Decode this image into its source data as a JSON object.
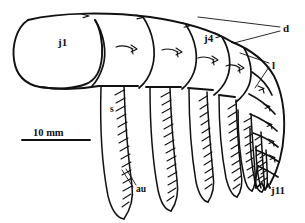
{
  "figure": {
    "background_color": "#ffffff",
    "ink_color": "#111111",
    "width_px": 305,
    "height_px": 223
  },
  "scale_bar": {
    "label": "10 mm",
    "length_px": 68,
    "x": 22,
    "y": 133
  },
  "labels": [
    {
      "key": "j1",
      "text": "j1",
      "x": 58,
      "y": 46,
      "size": "normal",
      "leader": false,
      "meaning": "antenna article 1 (peduncle segment 1)"
    },
    {
      "key": "j4",
      "text": "j4",
      "x": 204,
      "y": 42,
      "size": "normal",
      "leader": false,
      "meaning": "antenna article 4"
    },
    {
      "key": "j11",
      "text": "j11",
      "x": 271,
      "y": 194,
      "size": "normal",
      "leader": false,
      "meaning": "antenna article 11 (terminal)"
    },
    {
      "key": "d",
      "text": "d",
      "x": 283,
      "y": 28,
      "size": "normal",
      "leader": true,
      "meaning": "dorsal seta"
    },
    {
      "key": "l",
      "text": "l",
      "x": 272,
      "y": 66,
      "size": "normal",
      "leader": true,
      "meaning": "lateral seta"
    },
    {
      "key": "s",
      "text": "s",
      "x": 110,
      "y": 112,
      "size": "small",
      "leader": false,
      "meaning": "seta"
    },
    {
      "key": "au",
      "text": "au",
      "x": 136,
      "y": 190,
      "size": "small",
      "leader": true,
      "meaning": "aesthetasc"
    }
  ],
  "segments": [
    {
      "name": "j1",
      "order": 1,
      "has_seta_mark": false
    },
    {
      "name": "j2",
      "order": 2,
      "has_seta_mark": true
    },
    {
      "name": "j3",
      "order": 3,
      "has_seta_mark": true
    },
    {
      "name": "j4",
      "order": 4,
      "has_seta_mark": true
    },
    {
      "name": "j5",
      "order": 5,
      "has_seta_mark": true
    },
    {
      "name": "j6",
      "order": 6,
      "has_seta_mark": true
    },
    {
      "name": "j7",
      "order": 7,
      "has_seta_mark": true
    },
    {
      "name": "j8",
      "order": 8,
      "has_seta_mark": true
    },
    {
      "name": "j9",
      "order": 9,
      "has_seta_mark": true
    },
    {
      "name": "j10",
      "order": 10,
      "has_seta_mark": true
    },
    {
      "name": "j11",
      "order": 11,
      "has_seta_mark": true
    }
  ],
  "seta_rows": {
    "count": 8,
    "description": "pectinate setae with barbed inner margins descending from each article"
  }
}
